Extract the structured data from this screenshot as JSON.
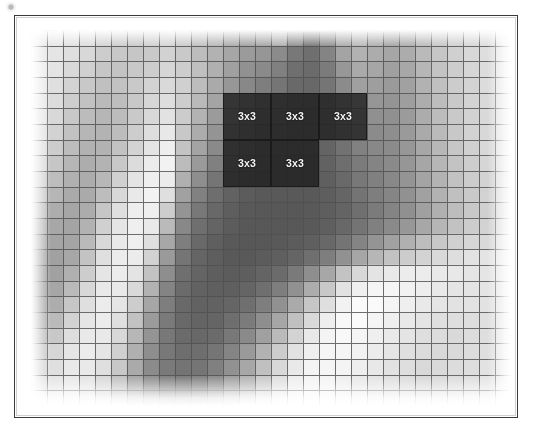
{
  "figure": {
    "type": "pixelated-grayscale-image-with-grid",
    "caption": "",
    "frame": {
      "border_color": "#3a3a3a",
      "background": "#ffffff"
    }
  },
  "grid": {
    "columns": 30,
    "rows": 24,
    "cell_width_px": 16,
    "cell_height_px": 15.67,
    "line_color": "#4f4f4f",
    "line_width_px": 1,
    "origin_x_px": 30,
    "origin_y_px": 29
  },
  "neighborhoods": {
    "size_label": "3x3",
    "box_fill": "#1f1f1f",
    "box_border": "#1b1b1b",
    "label_color": "#f4f4f4",
    "items": [
      {
        "name": "neighborhood-top-left",
        "label": "3x3",
        "col": 12,
        "row": 4,
        "span": 3
      },
      {
        "name": "neighborhood-top-middle",
        "label": "3x3",
        "col": 15,
        "row": 4,
        "span": 3
      },
      {
        "name": "neighborhood-top-right",
        "label": "3x3",
        "col": 18,
        "row": 4,
        "span": 3
      },
      {
        "name": "neighborhood-bottom-left",
        "label": "3x3",
        "col": 12,
        "row": 7,
        "span": 3
      },
      {
        "name": "neighborhood-bottom-middle",
        "label": "3x3",
        "col": 15,
        "row": 7,
        "span": 3
      }
    ]
  },
  "chart_data": {
    "type": "heatmap",
    "title": "",
    "xlabel": "",
    "ylabel": "",
    "colormap": "grayscale",
    "value_range": [
      0,
      255
    ],
    "grid": true,
    "legend": "none",
    "columns": 30,
    "rows": 24,
    "annotations": [
      "3x3",
      "3x3",
      "3x3",
      "3x3",
      "3x3"
    ],
    "values": [
      [
        228,
        232,
        226,
        222,
        214,
        208,
        206,
        210,
        214,
        206,
        196,
        186,
        176,
        168,
        170,
        178,
        150,
        128,
        150,
        176,
        186,
        178,
        170,
        176,
        190,
        200,
        210,
        218,
        224,
        230
      ],
      [
        230,
        230,
        224,
        216,
        206,
        200,
        198,
        202,
        210,
        202,
        190,
        178,
        166,
        156,
        150,
        140,
        120,
        112,
        132,
        164,
        178,
        172,
        166,
        172,
        186,
        198,
        208,
        216,
        222,
        228
      ],
      [
        232,
        228,
        218,
        208,
        198,
        196,
        200,
        206,
        214,
        206,
        192,
        176,
        160,
        146,
        138,
        128,
        112,
        108,
        124,
        152,
        170,
        166,
        160,
        168,
        182,
        196,
        206,
        214,
        220,
        226
      ],
      [
        230,
        224,
        212,
        200,
        192,
        194,
        202,
        212,
        218,
        208,
        190,
        170,
        152,
        136,
        126,
        118,
        106,
        104,
        118,
        140,
        160,
        158,
        154,
        162,
        178,
        192,
        204,
        212,
        220,
        226
      ],
      [
        228,
        220,
        206,
        194,
        186,
        190,
        200,
        214,
        222,
        206,
        186,
        164,
        142,
        126,
        116,
        110,
        100,
        100,
        112,
        132,
        150,
        150,
        148,
        158,
        174,
        190,
        202,
        212,
        218,
        224
      ],
      [
        226,
        216,
        200,
        188,
        182,
        188,
        202,
        216,
        226,
        204,
        180,
        156,
        134,
        118,
        108,
        104,
        98,
        98,
        108,
        126,
        142,
        144,
        144,
        156,
        172,
        188,
        202,
        210,
        218,
        224
      ],
      [
        224,
        210,
        194,
        182,
        180,
        190,
        206,
        222,
        232,
        200,
        172,
        148,
        126,
        112,
        102,
        100,
        96,
        96,
        104,
        120,
        136,
        140,
        142,
        154,
        170,
        186,
        200,
        210,
        216,
        222
      ],
      [
        220,
        204,
        188,
        178,
        178,
        194,
        212,
        228,
        238,
        196,
        164,
        138,
        118,
        106,
        98,
        96,
        94,
        94,
        100,
        114,
        130,
        136,
        140,
        152,
        168,
        184,
        198,
        208,
        216,
        222
      ],
      [
        214,
        198,
        182,
        174,
        180,
        200,
        220,
        236,
        242,
        188,
        154,
        128,
        110,
        100,
        94,
        92,
        92,
        92,
        98,
        110,
        124,
        132,
        138,
        150,
        166,
        182,
        196,
        206,
        214,
        220
      ],
      [
        206,
        190,
        176,
        172,
        184,
        208,
        228,
        240,
        236,
        176,
        142,
        118,
        104,
        96,
        92,
        90,
        90,
        90,
        96,
        106,
        120,
        128,
        136,
        148,
        164,
        180,
        194,
        204,
        212,
        218
      ],
      [
        196,
        182,
        170,
        170,
        190,
        216,
        234,
        242,
        224,
        162,
        130,
        110,
        98,
        92,
        90,
        90,
        90,
        90,
        94,
        102,
        116,
        126,
        134,
        146,
        162,
        178,
        192,
        202,
        210,
        216
      ],
      [
        186,
        174,
        166,
        172,
        198,
        224,
        238,
        240,
        206,
        148,
        120,
        104,
        94,
        90,
        88,
        88,
        88,
        90,
        94,
        100,
        112,
        124,
        132,
        144,
        160,
        176,
        190,
        200,
        208,
        214
      ],
      [
        176,
        168,
        164,
        178,
        208,
        230,
        240,
        234,
        186,
        136,
        112,
        100,
        92,
        88,
        88,
        88,
        88,
        90,
        96,
        104,
        116,
        128,
        138,
        152,
        168,
        182,
        194,
        204,
        210,
        216
      ],
      [
        168,
        164,
        164,
        186,
        216,
        234,
        240,
        224,
        168,
        126,
        106,
        96,
        90,
        88,
        88,
        90,
        92,
        96,
        104,
        116,
        132,
        148,
        162,
        176,
        190,
        200,
        208,
        214,
        218,
        222
      ],
      [
        162,
        162,
        168,
        196,
        224,
        236,
        236,
        210,
        154,
        118,
        102,
        94,
        90,
        90,
        92,
        96,
        102,
        112,
        126,
        146,
        166,
        182,
        194,
        204,
        212,
        218,
        222,
        226,
        228,
        230
      ],
      [
        158,
        162,
        176,
        206,
        230,
        236,
        228,
        194,
        142,
        112,
        100,
        94,
        92,
        94,
        100,
        108,
        122,
        142,
        168,
        196,
        216,
        228,
        234,
        236,
        236,
        234,
        232,
        230,
        230,
        230
      ],
      [
        158,
        166,
        186,
        216,
        234,
        234,
        218,
        178,
        132,
        108,
        98,
        96,
        96,
        102,
        112,
        126,
        146,
        172,
        200,
        226,
        240,
        246,
        246,
        242,
        238,
        234,
        230,
        228,
        228,
        228
      ],
      [
        162,
        174,
        198,
        224,
        236,
        230,
        206,
        166,
        126,
        106,
        98,
        98,
        102,
        112,
        126,
        146,
        170,
        198,
        224,
        242,
        250,
        250,
        246,
        240,
        234,
        230,
        226,
        226,
        226,
        226
      ],
      [
        170,
        186,
        210,
        230,
        236,
        224,
        194,
        156,
        122,
        106,
        100,
        102,
        110,
        124,
        142,
        166,
        192,
        218,
        238,
        248,
        250,
        246,
        240,
        234,
        228,
        224,
        222,
        222,
        224,
        226
      ],
      [
        182,
        200,
        222,
        234,
        234,
        216,
        184,
        148,
        120,
        108,
        104,
        108,
        120,
        138,
        160,
        186,
        212,
        232,
        244,
        248,
        246,
        240,
        234,
        228,
        222,
        220,
        218,
        220,
        222,
        226
      ],
      [
        196,
        214,
        230,
        236,
        230,
        208,
        176,
        142,
        120,
        110,
        110,
        118,
        132,
        154,
        178,
        204,
        226,
        240,
        246,
        246,
        242,
        236,
        230,
        224,
        220,
        218,
        218,
        220,
        224,
        228
      ],
      [
        210,
        224,
        234,
        234,
        224,
        200,
        170,
        140,
        122,
        116,
        118,
        128,
        146,
        168,
        192,
        216,
        234,
        244,
        246,
        244,
        238,
        232,
        226,
        222,
        218,
        218,
        220,
        222,
        226,
        230
      ],
      [
        220,
        230,
        234,
        230,
        218,
        194,
        166,
        142,
        128,
        124,
        128,
        140,
        158,
        180,
        202,
        224,
        238,
        244,
        244,
        240,
        234,
        228,
        224,
        220,
        218,
        218,
        220,
        224,
        228,
        232
      ],
      [
        228,
        232,
        232,
        226,
        212,
        190,
        166,
        146,
        136,
        134,
        140,
        152,
        170,
        190,
        210,
        230,
        240,
        244,
        242,
        238,
        232,
        226,
        222,
        220,
        218,
        220,
        222,
        226,
        230,
        234
      ]
    ]
  }
}
